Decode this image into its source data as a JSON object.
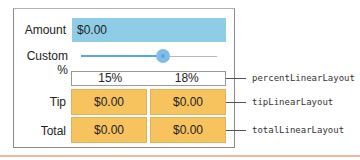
{
  "form": {
    "amount_label": "Amount",
    "amount_value": "$0.00",
    "custom_label": "Custom %",
    "slider": {
      "position_percent": 60
    },
    "percent_row": [
      "15%",
      "18%"
    ],
    "tip_label": "Tip",
    "tip_values": [
      "$0.00",
      "$0.00"
    ],
    "total_label": "Total",
    "total_values": [
      "$0.00",
      "$0.00"
    ]
  },
  "annotations": {
    "percent": "percentLinearLayout",
    "tip": "tipLinearLayout",
    "total": "totalLinearLayout"
  },
  "colors": {
    "amount_bg": "#8fcde6",
    "slider_accent": "#5aa9de",
    "result_bg": "#f7c35f"
  }
}
